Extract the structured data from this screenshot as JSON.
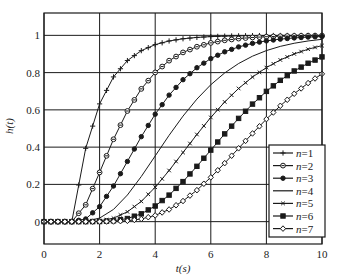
{
  "chart_data": {
    "type": "line",
    "title": "",
    "xlabel": "t(s)",
    "ylabel": "h(t)",
    "xlim": [
      0,
      10
    ],
    "ylim": [
      -0.12,
      1.12
    ],
    "xticks": [
      0,
      2,
      4,
      6,
      8,
      10
    ],
    "xtick_labels": [
      "0",
      "2",
      "4",
      "6",
      "8",
      "10"
    ],
    "yticks": [
      0,
      0.2,
      0.4,
      0.6,
      0.8,
      1
    ],
    "ytick_labels": [
      "0",
      "0.2",
      "0.4",
      "0.6",
      "0.8",
      "1"
    ],
    "grid": true,
    "legend_position": "lower right",
    "x": [
      0,
      0.5,
      1,
      1.5,
      2,
      2.5,
      3,
      3.5,
      4,
      4.5,
      5,
      5.5,
      6,
      6.5,
      7,
      7.5,
      8,
      8.5,
      9,
      9.5,
      10
    ],
    "series": [
      {
        "name": "n=1",
        "marker": "plus",
        "values": [
          0,
          0,
          0,
          0.3935,
          0.6321,
          0.7769,
          0.8647,
          0.9179,
          0.9502,
          0.9698,
          0.9817,
          0.9889,
          0.9933,
          0.9959,
          0.9975,
          0.9985,
          0.9991,
          0.9994,
          0.9997,
          0.9998,
          0.9999
        ]
      },
      {
        "name": "n=2",
        "marker": "circle",
        "values": [
          0,
          0,
          0,
          0.0902,
          0.2642,
          0.4422,
          0.594,
          0.7127,
          0.8009,
          0.8641,
          0.9084,
          0.9389,
          0.9596,
          0.9734,
          0.9826,
          0.9887,
          0.9927,
          0.9953,
          0.997,
          0.9981,
          0.9988
        ]
      },
      {
        "name": "n=3",
        "marker": "dot",
        "values": [
          0,
          0,
          0,
          0.0144,
          0.0803,
          0.1912,
          0.3233,
          0.4562,
          0.5768,
          0.6792,
          0.7619,
          0.8264,
          0.8753,
          0.9116,
          0.938,
          0.957,
          0.9704,
          0.9797,
          0.9862,
          0.9907,
          0.9938
        ]
      },
      {
        "name": "n=4",
        "marker": "none",
        "values": [
          0,
          0,
          0,
          0.0018,
          0.019,
          0.0656,
          0.1429,
          0.2424,
          0.3528,
          0.4634,
          0.5665,
          0.6577,
          0.735,
          0.7983,
          0.8488,
          0.8882,
          0.9182,
          0.9409,
          0.9576,
          0.9699,
          0.9788
        ]
      },
      {
        "name": "n=5",
        "marker": "x",
        "values": [
          0,
          0,
          0,
          0.0002,
          0.0037,
          0.0186,
          0.0527,
          0.1088,
          0.1847,
          0.2746,
          0.3712,
          0.4679,
          0.5595,
          0.6425,
          0.7149,
          0.7763,
          0.827,
          0.8679,
          0.9004,
          0.9256,
          0.945
        ]
      },
      {
        "name": "n=6",
        "marker": "square",
        "values": [
          0,
          0,
          0,
          0,
          0.0006,
          0.0045,
          0.0166,
          0.042,
          0.0839,
          0.1424,
          0.2149,
          0.2971,
          0.384,
          0.4711,
          0.5543,
          0.631,
          0.6993,
          0.7586,
          0.8088,
          0.8504,
          0.8843
        ]
      },
      {
        "name": "n=7",
        "marker": "diamond",
        "values": [
          0,
          0,
          0,
          0,
          0.0001,
          0.0009,
          0.0045,
          0.0142,
          0.0335,
          0.0653,
          0.1107,
          0.169,
          0.2378,
          0.314,
          0.3937,
          0.4735,
          0.5503,
          0.6218,
          0.6866,
          0.7438,
          0.7932
        ]
      }
    ]
  },
  "colors": {
    "line": "#1a1a1a",
    "grid": "#1a1a1a",
    "background": "#ffffff"
  }
}
